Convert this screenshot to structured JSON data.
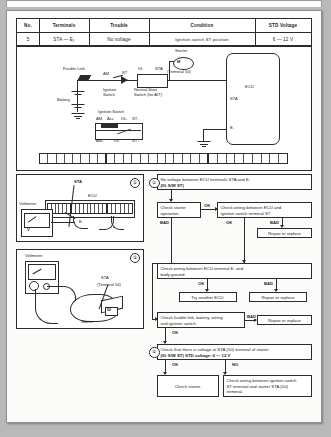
{
  "document": {
    "type": "automotive-troubleshooting-page",
    "title": "Ignition switch ST signal inspection"
  },
  "spec_table": {
    "headers": [
      "No.",
      "Terminals",
      "Trouble",
      "Condition",
      "STD Voltage"
    ],
    "rows": [
      {
        "no": "5",
        "terminals": "STA — E₁",
        "trouble": "No voltage",
        "condition": "Ignition switch ST position",
        "std_voltage": "6 — 12 V"
      }
    ]
  },
  "wiring_diagram": {
    "labels": {
      "fusible_link": "Fusible Link",
      "am": "AM",
      "st": "ST",
      "ig": "IG",
      "sta": "STA",
      "ignition_switch": "Ignition\nSwitch",
      "neutral_start_switch": "Neutral Start\nSwitch (for A/T)",
      "starter": "Starter",
      "terminal_50": "(Terminal 50)",
      "ecu": "ECU",
      "ecu_sta": "STA",
      "ecu_e1": "E₁",
      "battery": "Battery",
      "ign_sw_title": "Ignition Switch",
      "ign_top_row": [
        "AM",
        "Acc",
        "IG₂",
        "ST₁"
      ],
      "ign_bottom_row": [
        "AM₁",
        "IG₁",
        "ST₂"
      ]
    }
  },
  "panels": [
    {
      "marker": "①",
      "labels": {
        "sta": "STA",
        "ecu": "ECU",
        "e1": "E₁",
        "voltmeter": "Voltmeter",
        "volt_unit": "V"
      }
    },
    {
      "marker": "②",
      "labels": {
        "voltmeter": "Voltmeter",
        "sta": "STA",
        "terminal_50": "(Terminal 50)",
        "starter": "Starter"
      }
    }
  ],
  "flowchart": {
    "title_box": {
      "marker": "①",
      "line1": "No voltage between ECU terminals STA and E₁",
      "line2": "(IG S/W ST)"
    },
    "boxes": {
      "check_starter_operation": "Check starter\noperation.",
      "check_wiring_ecu_ign": "Check wiring between ECU and\nignition switch terminal ST",
      "repair_or_replace_1": "Repair or replace",
      "check_wiring_e1_ground": "Check wiring between ECU terminal E₁ and\nbody ground.",
      "try_another_ecu": "Try another ECU.",
      "repair_or_replace_2": "Repair or replace",
      "check_fusible_link": "Check fusible link, battery, wiring\nand ignition switch.",
      "repair_or_replace_3": "Repair or replace",
      "check_voltage_sta": {
        "marker": "②",
        "line1": "Check that there is voltage at STA (50) terminal of starter.",
        "line2_bold": "(IG S/W ST)        STD voltage:   6 — 12 V"
      },
      "check_starter": "Check starter.",
      "check_wiring_ign_starter": "Check wiring between ignition switch\nST terminal and starter STA (50)\nterminal."
    },
    "flags": {
      "ok": "OK",
      "bad": "BAD",
      "no": "NO"
    }
  },
  "colors": {
    "ink": "#2b2b2b",
    "paper": "#fbfbfa",
    "backdrop": "#b9b9b9"
  }
}
